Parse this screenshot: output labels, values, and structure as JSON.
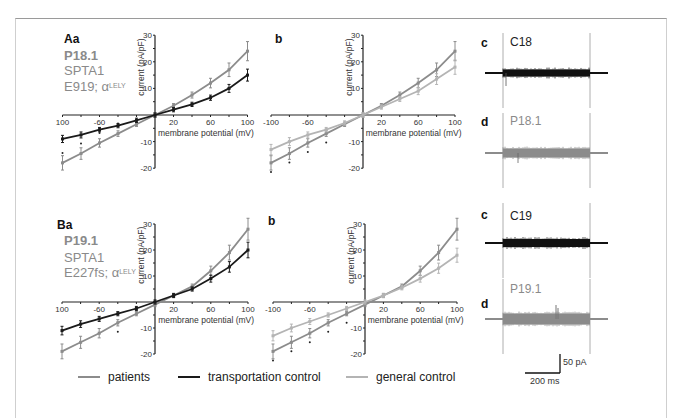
{
  "figure": {
    "row_A": {
      "panel_a_label": "Aa",
      "patient_id": "P18.1",
      "gene": "SPTA1",
      "mutation": "E919; α",
      "mutation_sup": "LELY",
      "panel_b_label": "b",
      "panel_c_label": "c",
      "trace_c_label": "C18",
      "panel_d_label": "d",
      "trace_d_label": "P18.1"
    },
    "row_B": {
      "panel_a_label": "Ba",
      "patient_id": "P19.1",
      "gene": "SPTA1",
      "mutation": "E227fs; α",
      "mutation_sup": "LELY",
      "panel_b_label": "b",
      "panel_c_label": "c",
      "trace_c_label": "C19",
      "panel_d_label": "d",
      "trace_d_label": "P19.1"
    },
    "axes": {
      "xlabel": "membrane potential (mV)",
      "ylabel": "current (pA/pF)",
      "xticks": [
        "100",
        "-60",
        "20",
        "60",
        "100"
      ],
      "xticks_b": [
        "-100",
        "-60",
        "20",
        "60",
        "100"
      ],
      "yticks": [
        "30",
        "20",
        "10",
        "-10",
        "-20"
      ]
    },
    "scale_bar": {
      "vertical": "50 pA",
      "horizontal": "200 ms"
    },
    "legend": [
      {
        "label": "patients",
        "color": "#8c8c8c"
      },
      {
        "label": "transportation control",
        "color": "#1a1a1a"
      },
      {
        "label": "general control",
        "color": "#b4b4b4"
      }
    ]
  },
  "chart_data": [
    {
      "type": "line",
      "title": "Aa — P18.1 vs transportation control",
      "xlabel": "membrane potential (mV)",
      "ylabel": "current (pA/pF)",
      "x": [
        -100,
        -80,
        -60,
        -40,
        -20,
        0,
        20,
        40,
        60,
        80,
        100
      ],
      "series": [
        {
          "name": "patients",
          "values": [
            -18,
            -14.5,
            -10.5,
            -7,
            -3.5,
            0,
            3.5,
            7.5,
            12,
            17,
            24
          ]
        },
        {
          "name": "transportation control",
          "values": [
            -9,
            -7.5,
            -5.5,
            -4,
            -2,
            0,
            2,
            4,
            6.5,
            10,
            15
          ]
        }
      ],
      "significance_marks_at_x": [
        -100,
        -80,
        -60,
        -40
      ],
      "xlim": [
        -100,
        100
      ],
      "ylim": [
        -20,
        30
      ],
      "grid": false
    },
    {
      "type": "line",
      "title": "Ab — P18.1 vs general control",
      "xlabel": "membrane potential (mV)",
      "ylabel": "current (pA/pF)",
      "x": [
        -100,
        -80,
        -60,
        -40,
        -20,
        0,
        20,
        40,
        60,
        80,
        100
      ],
      "series": [
        {
          "name": "patients",
          "values": [
            -18,
            -14.5,
            -10.5,
            -7,
            -3.5,
            0,
            3.5,
            7.5,
            12,
            17,
            24
          ]
        },
        {
          "name": "general control",
          "values": [
            -13,
            -10,
            -7.5,
            -5.5,
            -3,
            0,
            3,
            6,
            9,
            13.5,
            18
          ]
        }
      ],
      "significance_marks_at_x": [
        -100,
        -80,
        -60,
        -40
      ],
      "xlim": [
        -100,
        100
      ],
      "ylim": [
        -20,
        30
      ],
      "grid": false
    },
    {
      "type": "line",
      "title": "Ba — P19.1 vs transportation control",
      "xlabel": "membrane potential (mV)",
      "ylabel": "current (pA/pF)",
      "x": [
        -100,
        -80,
        -60,
        -40,
        -20,
        0,
        20,
        40,
        60,
        80,
        100
      ],
      "series": [
        {
          "name": "patients",
          "values": [
            -19,
            -15.5,
            -12,
            -8,
            -4.5,
            -1,
            2.5,
            6,
            12,
            19,
            28
          ]
        },
        {
          "name": "transportation control",
          "values": [
            -11,
            -8.5,
            -6.5,
            -4.5,
            -2.5,
            0,
            2.5,
            5,
            9,
            13.5,
            20
          ]
        }
      ],
      "significance_marks_at_x": [
        -40
      ],
      "xlim": [
        -100,
        100
      ],
      "ylim": [
        -20,
        30
      ],
      "grid": false
    },
    {
      "type": "line",
      "title": "Bb — P19.1 vs general control",
      "xlabel": "membrane potential (mV)",
      "ylabel": "current (pA/pF)",
      "x": [
        -100,
        -80,
        -60,
        -40,
        -20,
        0,
        20,
        40,
        60,
        80,
        100
      ],
      "series": [
        {
          "name": "patients",
          "values": [
            -19,
            -15.5,
            -12,
            -8,
            -4.5,
            -1,
            2.5,
            6,
            12,
            19,
            28
          ]
        },
        {
          "name": "general control",
          "values": [
            -13,
            -10,
            -7.5,
            -5,
            -2.5,
            0,
            2.5,
            5.5,
            9,
            13,
            18
          ]
        }
      ],
      "significance_marks_at_x": [
        -100,
        -80,
        -60,
        -40,
        -20
      ],
      "xlim": [
        -100,
        100
      ],
      "ylim": [
        -20,
        30
      ],
      "grid": false
    }
  ]
}
